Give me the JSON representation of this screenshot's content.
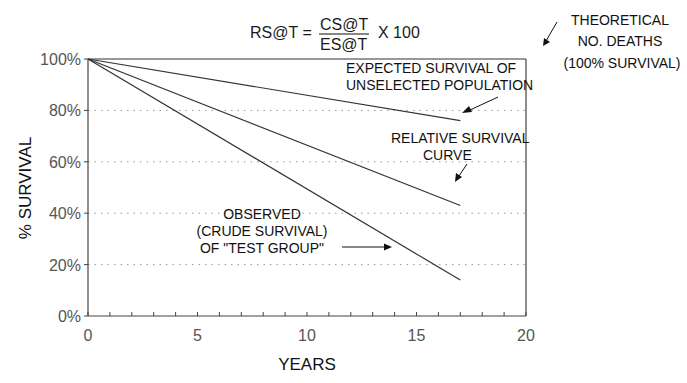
{
  "chart_data": {
    "type": "line",
    "title": "",
    "formula": {
      "lhs": "RS@T =",
      "numerator": "CS@T",
      "denominator": "ES@T",
      "rhs": "X 100"
    },
    "xlabel": "YEARS",
    "ylabel": "% SURVIVAL",
    "xlim": [
      0,
      20
    ],
    "ylim": [
      0,
      100
    ],
    "x_ticks": [
      0,
      5,
      10,
      15,
      20
    ],
    "x_tick_labels": [
      "0",
      "5",
      "10",
      "15",
      "20"
    ],
    "x_minor_step": 1,
    "y_ticks": [
      0,
      20,
      40,
      60,
      80,
      100
    ],
    "y_tick_labels": [
      "0%",
      "20%",
      "40%",
      "60%",
      "80%",
      "100%"
    ],
    "grid": "horizontal-dotted",
    "series": [
      {
        "name": "Theoretical no. deaths (100% survival)",
        "x": [
          0,
          20
        ],
        "y": [
          100,
          100
        ]
      },
      {
        "name": "Expected survival of unselected population",
        "x": [
          0,
          17
        ],
        "y": [
          100,
          76
        ]
      },
      {
        "name": "Relative survival curve",
        "x": [
          0,
          17
        ],
        "y": [
          100,
          43
        ]
      },
      {
        "name": "Observed (crude survival) of test group",
        "x": [
          0,
          17
        ],
        "y": [
          100,
          14
        ]
      }
    ],
    "annotations": [
      {
        "id": "theoretical",
        "lines": [
          "THEORETICAL",
          "NO. DEATHS",
          "(100% SURVIVAL)"
        ]
      },
      {
        "id": "expected",
        "lines": [
          "EXPECTED SURVIVAL OF",
          "UNSELECTED POPULATION"
        ]
      },
      {
        "id": "relative",
        "lines": [
          "RELATIVE SURVIVAL",
          "CURVE"
        ]
      },
      {
        "id": "observed",
        "lines": [
          "OBSERVED",
          "(CRUDE SURVIVAL)",
          "OF \"TEST GROUP\""
        ]
      }
    ]
  }
}
